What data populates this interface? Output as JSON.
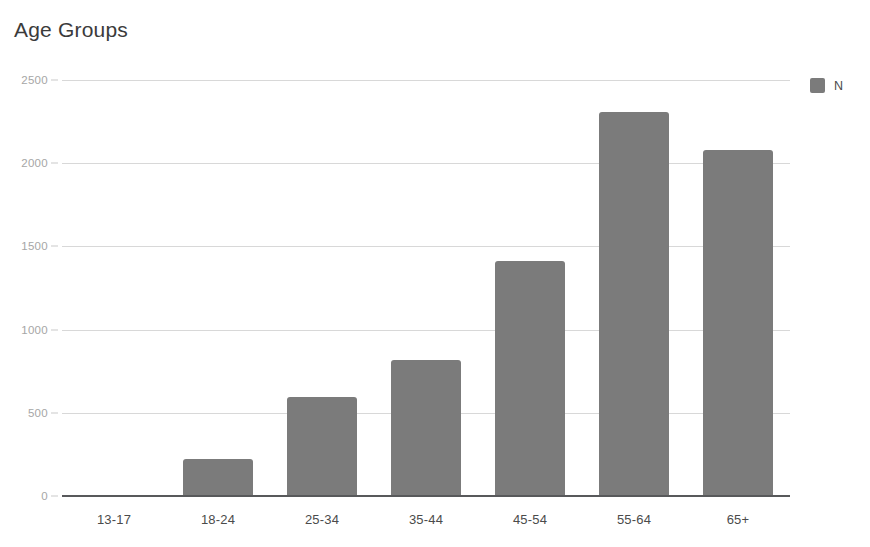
{
  "chart_data": {
    "type": "bar",
    "title": "Age Groups",
    "xlabel": "",
    "ylabel": "",
    "categories": [
      "13-17",
      "18-24",
      "25-34",
      "35-44",
      "45-54",
      "55-64",
      "65+"
    ],
    "series": [
      {
        "name": "N",
        "values": [
          0,
          220,
          595,
          815,
          1410,
          2310,
          2080
        ],
        "color": "#7b7b7b"
      }
    ],
    "ylim": [
      0,
      2500
    ],
    "yticks": [
      0,
      500,
      1000,
      1500,
      2000,
      2500
    ],
    "ytick_labels": [
      "0",
      "500",
      "1000",
      "1500",
      "2000",
      "2500"
    ],
    "grid": true,
    "legend": {
      "position": "right",
      "entries": [
        {
          "label": "N",
          "color": "#7b7b7b",
          "swatch_name": "legend-swatch-n"
        }
      ]
    }
  },
  "colors": {
    "bar": "#7b7b7b",
    "gridline": "#d8d8d8",
    "axis_line": "#58595b",
    "title_text": "#3b3b3b",
    "tick_text_y": "#a6a6a6",
    "tick_text_x": "#4b4b4b",
    "background": "#ffffff"
  }
}
